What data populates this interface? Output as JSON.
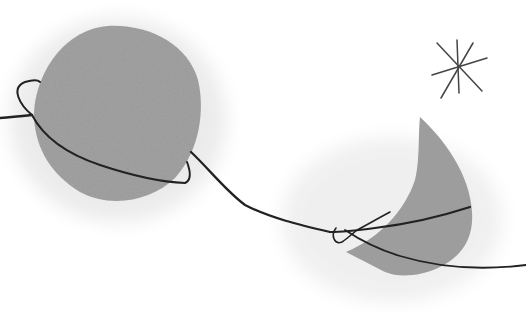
{
  "artwork": {
    "description": "Abstract illustration of a grey planet with an orbiting ring, a crescent moon, a star, and a wavy black line",
    "colors": {
      "background": "#ffffff",
      "planet": "#9b9b9b",
      "moon": "#9d9d9d",
      "halo": "#e6e6e6",
      "line": "#222222",
      "star": "#444444"
    }
  }
}
